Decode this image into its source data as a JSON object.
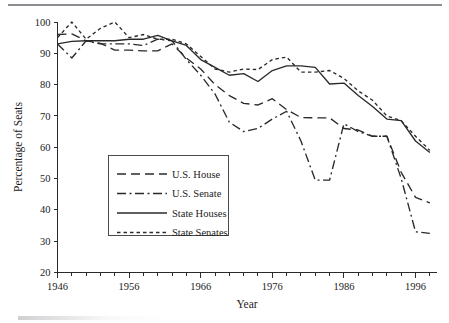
{
  "chart_data": {
    "type": "line",
    "title": "",
    "xlabel": "Year",
    "ylabel": "Percentage of Seats",
    "xlim": [
      1946,
      1999
    ],
    "ylim": [
      20,
      100
    ],
    "xticks_major": [
      1946,
      1956,
      1966,
      1976,
      1986,
      1996
    ],
    "xtick_labels": [
      "1946",
      "1956",
      "1966",
      "1976",
      "1986",
      "1996"
    ],
    "xtick_minor_step": 2,
    "yticks": [
      20,
      30,
      40,
      50,
      60,
      70,
      80,
      90,
      100
    ],
    "ytick_labels": [
      "20",
      "30",
      "40",
      "50",
      "60",
      "70",
      "80",
      "90",
      "100"
    ],
    "grid": false,
    "legend_position": "center-left",
    "x": [
      1946,
      1948,
      1950,
      1952,
      1954,
      1956,
      1958,
      1960,
      1962,
      1964,
      1966,
      1968,
      1970,
      1972,
      1974,
      1976,
      1978,
      1980,
      1982,
      1984,
      1986,
      1988,
      1990,
      1992,
      1994,
      1996,
      1998
    ],
    "series": [
      {
        "name": "U.S. House",
        "dash": "long-dash",
        "values": [
          96.0,
          96.2,
          94.0,
          93.2,
          91.0,
          91.0,
          90.8,
          90.8,
          93.0,
          88.5,
          85.0,
          80.0,
          76.5,
          74.0,
          73.5,
          75.5,
          72.0,
          69.5,
          69.4,
          69.4,
          66.0,
          65.5,
          63.5,
          63.5,
          52.0,
          44.0,
          42.2
        ]
      },
      {
        "name": "U.S. Senate",
        "dash": "dash-dot",
        "values": [
          93.0,
          88.5,
          94.0,
          93.0,
          93.0,
          93.0,
          92.5,
          94.5,
          94.0,
          88.0,
          83.0,
          77.0,
          68.0,
          65.0,
          66.0,
          69.0,
          71.5,
          62.0,
          49.5,
          49.5,
          67.5,
          65.0,
          63.5,
          63.5,
          50.0,
          33.0,
          32.5
        ]
      },
      {
        "name": "State Houses",
        "dash": "solid",
        "values": [
          93.0,
          93.8,
          94.0,
          94.0,
          94.0,
          94.5,
          94.5,
          95.7,
          94.0,
          92.5,
          88.0,
          85.5,
          83.0,
          83.5,
          81.0,
          84.5,
          86.0,
          86.0,
          85.5,
          80.2,
          80.5,
          76.5,
          73.0,
          69.0,
          68.5,
          62.0,
          58.3
        ]
      },
      {
        "name": "State Senates",
        "dash": "dotted",
        "values": [
          95.0,
          100.0,
          94.5,
          98.0,
          100.0,
          95.0,
          96.0,
          94.5,
          94.5,
          93.0,
          89.0,
          85.0,
          84.0,
          85.0,
          84.8,
          88.0,
          88.8,
          84.0,
          84.0,
          84.5,
          82.0,
          78.0,
          75.0,
          70.0,
          68.5,
          63.5,
          59.0
        ]
      }
    ]
  },
  "legend": {
    "items": [
      {
        "label": "U.S. House"
      },
      {
        "label": "U.S. Senate"
      },
      {
        "label": "State Houses"
      },
      {
        "label": "State Senates"
      }
    ]
  },
  "axes": {
    "y_title": "Percentage of Seats",
    "x_title": "Year"
  },
  "colors": {
    "ink": "#2a2a2a",
    "rule": "#8d8d91",
    "background": "#ffffff"
  }
}
